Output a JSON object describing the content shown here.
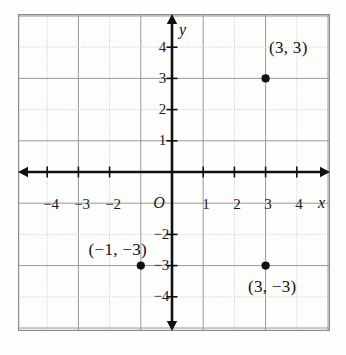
{
  "chart_data": {
    "type": "scatter",
    "title": "",
    "xlabel": "x",
    "ylabel": "y",
    "xlim": [
      -5,
      5
    ],
    "ylim": [
      -5,
      5
    ],
    "grid": true,
    "grid_step": 1,
    "legend": "none",
    "origin_label": "O",
    "x_ticks": [
      -4,
      -3,
      -2,
      1,
      2,
      3,
      4
    ],
    "x_tick_labels": [
      "−4",
      "−3",
      "−2",
      "1",
      "2",
      "3",
      "4"
    ],
    "y_ticks": [
      4,
      3,
      2,
      1,
      -2,
      -3,
      -4
    ],
    "y_tick_labels": [
      "4",
      "3",
      "2",
      "1",
      "−2",
      "−3",
      "−4"
    ],
    "points": [
      {
        "x": 3,
        "y": 3,
        "label": "(3, 3)",
        "label_pos": "upper-right"
      },
      {
        "x": 3,
        "y": -3,
        "label": "(3, −3)",
        "label_pos": "lower-right"
      },
      {
        "x": -1,
        "y": -3,
        "label": "(−1, −3)",
        "label_pos": "left"
      }
    ],
    "colors": {
      "axis": "#111111",
      "point": "#111111",
      "grid_solid": "#9a9a9a",
      "grid_dotted": "#c9c9c9",
      "frame": "#8c8c8c",
      "background": "#fdfdfc",
      "text": "#111111"
    }
  }
}
